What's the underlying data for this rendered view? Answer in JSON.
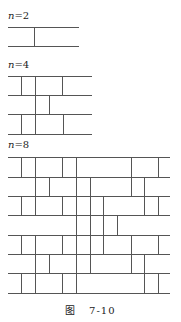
{
  "figure": {
    "caption_prefix": "图",
    "caption_number": "7-10",
    "stroke_color": "#555555"
  },
  "diagrams": [
    {
      "label_var": "n",
      "label_rest": "=2",
      "label_pos": [
        8,
        11
      ],
      "x_start": 8,
      "x_end": 79,
      "rows_y": [
        27,
        46
      ],
      "verticals": [
        [
          34
        ]
      ]
    },
    {
      "label_var": "n",
      "label_rest": "=4",
      "label_pos": [
        8,
        60
      ],
      "x_start": 8,
      "x_end": 92,
      "rows_y": [
        76,
        95,
        114,
        134
      ],
      "verticals": [
        [
          21,
          35,
          62
        ],
        [
          35,
          49
        ],
        [
          21,
          35,
          63
        ]
      ]
    },
    {
      "label_var": "n",
      "label_rest": "=8",
      "label_pos": [
        8,
        140
      ],
      "x_start": 8,
      "x_end": 170,
      "rows_y": [
        157,
        177,
        196,
        215,
        235,
        254,
        273,
        293
      ],
      "verticals": [
        [
          21,
          35,
          62,
          76,
          131,
          158
        ],
        [
          35,
          49,
          76,
          90,
          131,
          144
        ],
        [
          21,
          35,
          62,
          76,
          90,
          103,
          144,
          158
        ],
        [
          76,
          90,
          103,
          117
        ],
        [
          21,
          35,
          62,
          76,
          90,
          103,
          131,
          158
        ],
        [
          35,
          49,
          76,
          90,
          131,
          144
        ],
        [
          21,
          35,
          62,
          76,
          144,
          158
        ]
      ]
    }
  ]
}
